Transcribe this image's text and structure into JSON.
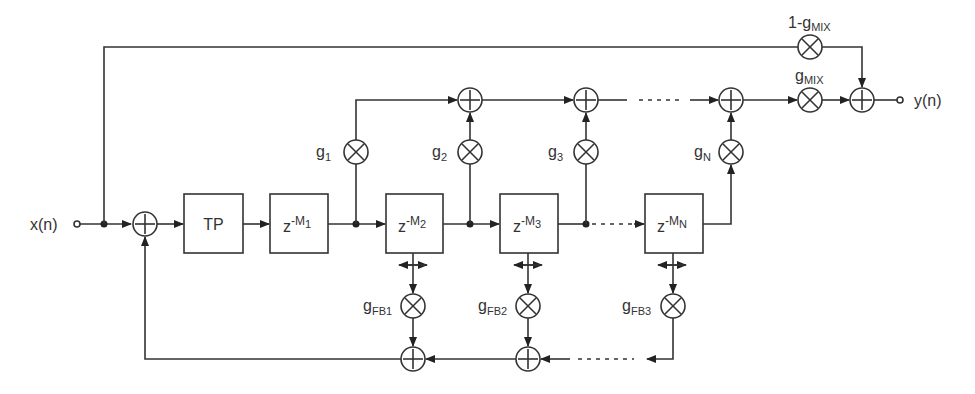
{
  "diagram": {
    "input_label": "x(n)",
    "output_label": "y(n)",
    "blocks": [
      {
        "id": "tp",
        "label": "TP"
      },
      {
        "id": "delay1",
        "base": "z",
        "exp_prefix": "-M",
        "exp_sub": "1"
      },
      {
        "id": "delay2",
        "base": "z",
        "exp_prefix": "-M",
        "exp_sub": "2"
      },
      {
        "id": "delay3",
        "base": "z",
        "exp_prefix": "-M",
        "exp_sub": "3"
      },
      {
        "id": "delayN",
        "base": "z",
        "exp_prefix": "-M",
        "exp_sub": "N"
      }
    ],
    "tap_gains": [
      {
        "base": "g",
        "sub": "1"
      },
      {
        "base": "g",
        "sub": "2"
      },
      {
        "base": "g",
        "sub": "3"
      },
      {
        "base": "g",
        "sub": "N"
      }
    ],
    "feedback_gains": [
      {
        "base": "g",
        "sub": "FB1"
      },
      {
        "base": "g",
        "sub": "FB2"
      },
      {
        "base": "g",
        "sub": "FB3"
      }
    ],
    "mix_gains": {
      "dry": {
        "prefix": "1-",
        "base": "g",
        "sub": "MIX"
      },
      "wet": {
        "base": "g",
        "sub": "MIX"
      }
    },
    "symbols": {
      "adder": "+",
      "multiplier": "×"
    }
  }
}
